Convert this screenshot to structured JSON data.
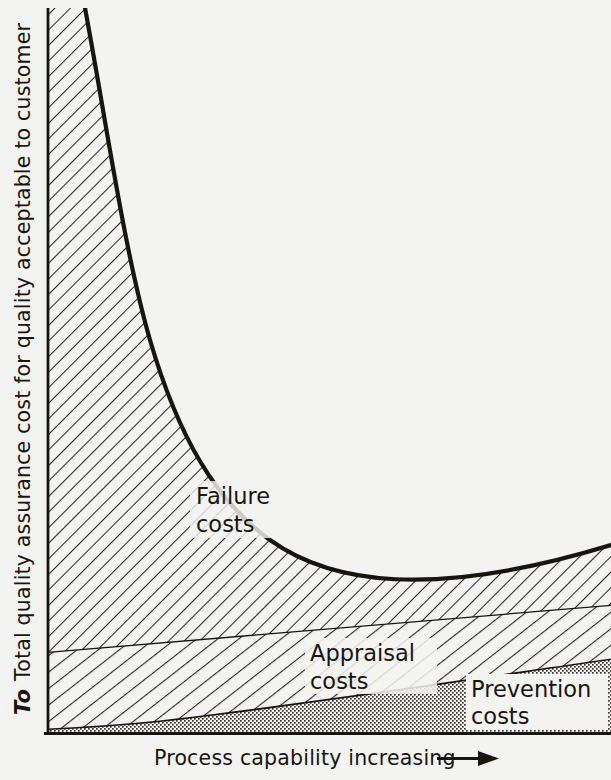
{
  "figure": {
    "kind": "quality-cost-curve-diagram"
  },
  "axes": {
    "y_label": "Total quality assurance cost for quality acceptable to customer",
    "y_origin_label": "To",
    "x_label": "Process capability increasing",
    "x_arrow_glyph": "⟶"
  },
  "regions": {
    "failure": {
      "line1": "Failure",
      "line2": "costs"
    },
    "appraisal": {
      "line1": "Appraisal",
      "line2": "costs"
    },
    "prevention": {
      "line1": "Prevention",
      "line2": "costs"
    }
  },
  "colors": {
    "paper": "#f3f3f1",
    "ink": "#17150f",
    "hatch": "#2b2722",
    "stipple": "#3a352e"
  },
  "chart_data": {
    "type": "area",
    "title": "",
    "xlabel": "Process capability increasing",
    "ylabel": "Total quality assurance cost for quality acceptable to customer",
    "xlim": [
      0,
      100
    ],
    "ylim": [
      0,
      100
    ],
    "grid": false,
    "legend": "inline-region-labels",
    "axis_tick_labels": {
      "x": [],
      "y": [
        "To"
      ]
    },
    "annotations": [
      {
        "text": "Failure costs",
        "x": 22,
        "y": 35
      },
      {
        "text": "Appraisal costs",
        "x": 52,
        "y": 13
      },
      {
        "text": "Prevention costs",
        "x": 80,
        "y": 6
      }
    ],
    "x": [
      0,
      5,
      10,
      15,
      20,
      25,
      30,
      35,
      40,
      45,
      50,
      55,
      60,
      65,
      70,
      75,
      80,
      85,
      90,
      95,
      100
    ],
    "series": [
      {
        "name": "Prevention costs",
        "pattern": "stipple",
        "values": [
          0.7,
          1.0,
          1.4,
          1.9,
          2.4,
          3.0,
          3.6,
          4.3,
          5.0,
          5.7,
          6.4,
          7.1,
          7.8,
          8.4,
          9.0,
          9.6,
          10.2,
          10.7,
          11.2,
          11.6,
          12.0
        ]
      },
      {
        "name": "Appraisal costs",
        "pattern": "hatch-shallow",
        "values": [
          10.2,
          10.4,
          10.6,
          10.9,
          11.2,
          11.6,
          12.0,
          12.4,
          12.9,
          13.4,
          13.9,
          14.4,
          14.9,
          15.4,
          15.9,
          16.4,
          16.9,
          17.3,
          17.7,
          18.0,
          18.3
        ]
      },
      {
        "name": "Failure costs",
        "pattern": "hatch-45",
        "values": [
          100.0,
          78.0,
          61.0,
          49.0,
          41.0,
          35.0,
          31.5,
          29.0,
          27.2,
          26.0,
          25.2,
          24.6,
          24.2,
          24.0,
          23.8,
          23.7,
          23.6,
          23.6,
          23.6,
          23.6,
          23.6
        ]
      }
    ]
  }
}
